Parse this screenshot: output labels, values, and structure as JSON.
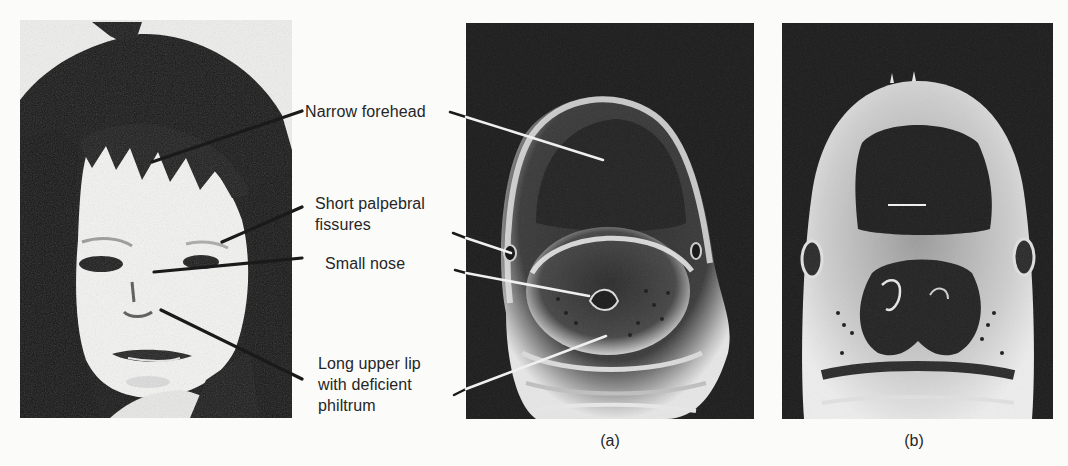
{
  "figure": {
    "photo_panel": {
      "description": "Photograph of child with facial features of fetal alcohol syndrome"
    },
    "panel_a": {
      "caption": "(a)",
      "description": "Scanning electron micrograph of affected embryo head"
    },
    "panel_b": {
      "caption": "(b)",
      "description": "Scanning electron micrograph of normal embryo head"
    },
    "annotations": [
      {
        "id": "forehead",
        "lines": [
          "Narrow forehead"
        ]
      },
      {
        "id": "palpebral",
        "lines": [
          "Short palpebral",
          "fissures"
        ]
      },
      {
        "id": "nose",
        "lines": [
          "Small nose"
        ]
      },
      {
        "id": "lip",
        "lines": [
          "Long upper lip",
          "with deficient",
          "philtrum"
        ]
      }
    ],
    "colors": {
      "page_background": "#fbfbfa",
      "text": "#262626",
      "photo_dark": "#151515",
      "sem_background": "#1b1b1b",
      "sem_highlight": "#e0e0e0",
      "leader_line_dark": "#1a1a1a",
      "leader_line_light": "#f2f2f2"
    }
  }
}
